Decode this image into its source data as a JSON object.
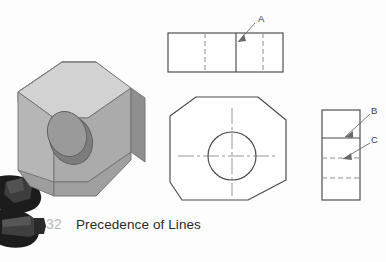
{
  "page": {
    "background_color": "#fdfdfd",
    "width": 386,
    "height": 262
  },
  "caption": {
    "page_number": "32",
    "title": "Precedence of Lines",
    "page_number_color": "#b9b9b9",
    "title_color": "#2a2a2a"
  },
  "pictorial": {
    "name": "isometric-block-with-hole",
    "description": "Shaded isometric view of a chamfered rectangular block with a through hole",
    "colors": {
      "top_face": "#cfcfcf",
      "front_face": "#a9a9a9",
      "side_face": "#8d8d8d",
      "bore": "#7a7a7a",
      "outline": "#6a6a6a"
    }
  },
  "decorations": [
    {
      "name": "dark-blob-upper",
      "color": "#1e1e1e"
    },
    {
      "name": "dark-blob-lower",
      "color": "#1e1e1e"
    }
  ],
  "views": {
    "top_view": {
      "name": "top-view",
      "shape": "rectangle",
      "solid_vertical_lines": 1,
      "hidden_vertical_lines": 2,
      "label": "A",
      "label_meaning": "visible line takes precedence over hidden line"
    },
    "front_view": {
      "name": "front-view",
      "shape": "chamfered-hexagon",
      "features": [
        "circular-hole",
        "horizontal-centerline",
        "vertical-centerline"
      ]
    },
    "right_side_view": {
      "name": "right-side-view",
      "shape": "rectangle",
      "solid_horizontal_lines": 1,
      "hidden_horizontal_lines": 2,
      "labels": [
        "B",
        "C"
      ],
      "label_b_meaning": "visible line",
      "label_c_meaning": "hidden line"
    }
  },
  "labels": {
    "a": "A",
    "b": "B",
    "c": "C"
  },
  "line_styles": {
    "visible_line_color": "#4a4a4a",
    "hidden_line_color": "#8a8a8a",
    "center_line_color": "#8a8a8a",
    "leader_color": "#6a6a6a"
  }
}
